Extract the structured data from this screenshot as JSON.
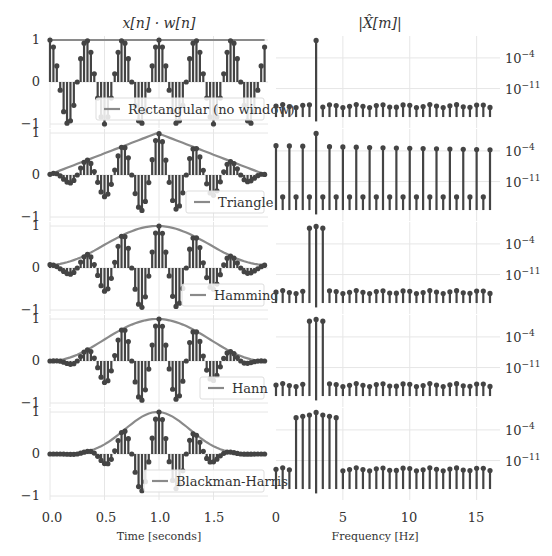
{
  "chart_data": {
    "type": "stem",
    "layout": {
      "rows": 5,
      "cols": 2,
      "grid": true
    },
    "column_titles": {
      "time": "x[n] · w[n]",
      "freq": "|X̂[m]|"
    },
    "time_axis": {
      "xlabel": "Time [seconds]",
      "xlim": [
        0,
        2
      ],
      "xticks": [
        0.0,
        0.5,
        1.0,
        1.5
      ],
      "xtick_labels": [
        "0.0",
        "0.5",
        "1.0",
        "1.5"
      ],
      "ylim": [
        -1,
        1
      ],
      "yticks": [
        1,
        0,
        -1
      ],
      "ytick_labels": [
        "1",
        "0",
        "−1"
      ]
    },
    "freq_axis": {
      "xlabel": "Frequency [Hz]",
      "xlim": [
        0,
        16
      ],
      "xticks": [
        0,
        5,
        10,
        15
      ],
      "xtick_labels": [
        "0",
        "5",
        "10",
        "15"
      ],
      "yscale": "log",
      "yticks_labels": [
        "10⁻⁴",
        "10⁻¹¹"
      ]
    },
    "signal": {
      "frequency_hz": 3,
      "duration_s": 2,
      "samples": 64,
      "sample_rate_hz": 32
    },
    "windows": [
      {
        "name": "Rectangular (no window)",
        "spectrum_peak_bins_hz": [
          3
        ],
        "sidelobe_level": "noise-floor ~1e-15"
      },
      {
        "name": "Triangle",
        "spectrum_peak_bins_hz": [
          3
        ],
        "sidelobe_level": "alternating between ~1e-3 and ~1e-14 across all bins"
      },
      {
        "name": "Hamming",
        "spectrum_peak_bins_hz": [
          2.5,
          3,
          3.5
        ],
        "sidelobe_level": "noise-floor ~1e-15"
      },
      {
        "name": "Hann",
        "spectrum_peak_bins_hz": [
          2.5,
          3,
          3.5
        ],
        "sidelobe_level": "noise-floor ~1e-15"
      },
      {
        "name": "Blackman-Harris",
        "spectrum_peak_bins_hz": [
          1.5,
          2,
          2.5,
          3,
          3.5,
          4,
          4.5
        ],
        "sidelobe_level": "noise-floor ~1e-13"
      }
    ]
  },
  "labels": {
    "time_title": "x[n] · w[n]",
    "freq_title": "|X̂[m]|",
    "time_xlabel": "Time [seconds]",
    "freq_xlabel": "Frequency [Hz]",
    "time_xticks": [
      "0.0",
      "0.5",
      "1.0",
      "1.5"
    ],
    "freq_xticks": [
      "0",
      "5",
      "10",
      "15"
    ],
    "yticks_time": [
      "1",
      "0",
      "−1"
    ],
    "yticks_freq": [
      "10",
      "−4",
      "10",
      "−11"
    ],
    "legends": [
      "Rectangular (no window)",
      "Triangle",
      "Hamming",
      "Hann",
      "Blackman-Harris"
    ]
  },
  "colors": {
    "stem": "#444444",
    "envelope": "#8a8a8a",
    "grid": "#e6e6e6",
    "text": "#333333"
  }
}
